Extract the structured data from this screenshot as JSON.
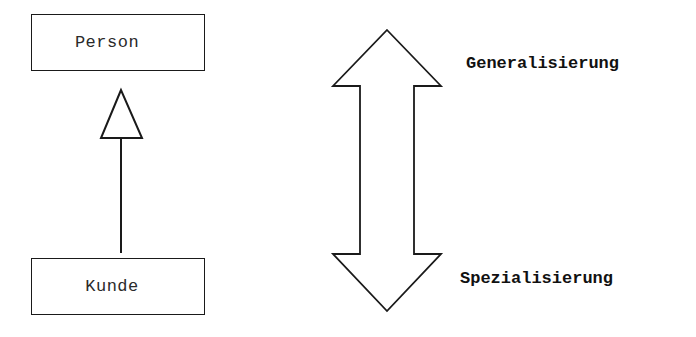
{
  "diagram": {
    "type": "UML inheritance",
    "classes": {
      "parent": {
        "name": "Person"
      },
      "child": {
        "name": "Kunde"
      }
    },
    "relationship": {
      "kind": "generalization",
      "arrowhead": "hollow-triangle",
      "from": "Kunde",
      "to": "Person"
    },
    "direction_arrow": {
      "kind": "double-headed block arrow",
      "top_label": "Generalisierung",
      "bottom_label": "Spezialisierung"
    },
    "colors": {
      "stroke": "#1a1a1a",
      "background": "#ffffff",
      "text": "#111111"
    }
  }
}
